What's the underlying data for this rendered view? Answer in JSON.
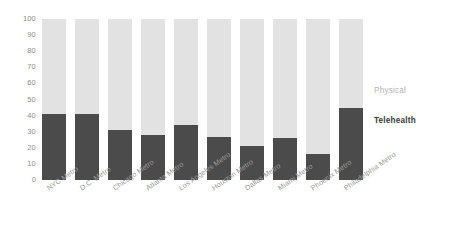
{
  "chart_data": {
    "type": "bar",
    "title": "",
    "subtitle": "",
    "xlabel": "",
    "ylabel": "",
    "ylim": [
      0,
      100
    ],
    "yticks": [
      100,
      90,
      80,
      70,
      60,
      50,
      40,
      30,
      20,
      10,
      0
    ],
    "grid": false,
    "stacked": true,
    "stack_total": 100,
    "legend_position": "right-inline-labels",
    "categories": [
      "NYC Metro",
      "D.C. Metro",
      "Chicago Metro",
      "Atlanta Metro",
      "Los Angeles Metro",
      "Houston Metro",
      "Dallas Metro",
      "Miami Metro",
      "Phoenix Metro",
      "Philadelphia Metro"
    ],
    "series": [
      {
        "name": "Telehealth",
        "color": "#4b4b4b",
        "values": [
          41,
          41,
          31,
          28,
          34,
          27,
          21,
          26,
          16,
          45
        ]
      },
      {
        "name": "Physical",
        "color": "#e2e2e2",
        "values": [
          59,
          59,
          69,
          72,
          66,
          73,
          79,
          74,
          84,
          55
        ]
      }
    ]
  },
  "labels": {
    "physical": "Physical",
    "telehealth": "Telehealth"
  },
  "colors": {
    "telehealth": "#4b4b4b",
    "physical": "#e2e2e2",
    "axis_text": "#8a8a8a",
    "category_text": "#9a9a9a",
    "background": "#ffffff"
  }
}
